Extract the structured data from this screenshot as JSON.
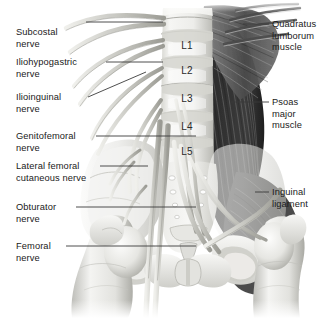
{
  "figure": {
    "palette": {
      "background": "#ffffff",
      "bone_light": "#f2f2f0",
      "bone_mid": "#d9d9d6",
      "bone_shadow": "#b3b3ae",
      "nerve_light": "#e4e4e0",
      "nerve_mid": "#bcbcb6",
      "nerve_dark": "#8d8d87",
      "muscle_dark": "#3a3a3a",
      "muscle_mid": "#6b6b6b",
      "muscle_light": "#9a9a9a",
      "leader_line": "#3b3b3b",
      "text": "#1a1a1a"
    }
  },
  "labels_left": [
    {
      "id": "subcostal-nerve",
      "lines": [
        "Subcostal",
        "nerve"
      ],
      "x": 16,
      "y": 27,
      "leader": {
        "x1": 86,
        "y1": 22,
        "x2": 163,
        "y2": 22
      }
    },
    {
      "id": "iliohypogastric-nerve",
      "lines": [
        "Iliohypogastric",
        "nerve"
      ],
      "x": 16,
      "y": 57,
      "leader": {
        "x1": 106,
        "y1": 62,
        "x2": 163,
        "y2": 62
      }
    },
    {
      "id": "ilioinguinal-nerve",
      "lines": [
        "Ilioinguinal",
        "nerve"
      ],
      "x": 16,
      "y": 92,
      "leader": {
        "x1": 88,
        "y1": 97,
        "x2": 146,
        "y2": 72
      }
    },
    {
      "id": "genitofemoral-nerve",
      "lines": [
        "Genitofemoral",
        "nerve"
      ],
      "x": 16,
      "y": 131,
      "leader": {
        "x1": 96,
        "y1": 136,
        "x2": 196,
        "y2": 136
      }
    },
    {
      "id": "lateral-femoral-cutaneous-nerve",
      "lines": [
        "Lateral femoral",
        "cutaneous nerve"
      ],
      "x": 16,
      "y": 161,
      "leader": {
        "x1": 100,
        "y1": 166,
        "x2": 148,
        "y2": 166
      }
    },
    {
      "id": "obturator-nerve",
      "lines": [
        "Obturator",
        "nerve"
      ],
      "x": 16,
      "y": 202,
      "leader": {
        "x1": 76,
        "y1": 207,
        "x2": 196,
        "y2": 207
      }
    },
    {
      "id": "femoral-nerve",
      "lines": [
        "Femoral",
        "nerve"
      ],
      "x": 16,
      "y": 241,
      "leader": {
        "x1": 66,
        "y1": 246,
        "x2": 196,
        "y2": 246
      }
    }
  ],
  "labels_right": [
    {
      "id": "quadratus-lumborum-muscle",
      "lines": [
        "Quadratus",
        "lumborum",
        "muscle"
      ],
      "x": 272,
      "y": 19,
      "leader": {
        "x1": 243,
        "y1": 24,
        "x2": 269,
        "y2": 24
      }
    },
    {
      "id": "psoas-major-muscle",
      "lines": [
        "Psoas",
        "major",
        "muscle"
      ],
      "x": 272,
      "y": 97,
      "leader": {
        "x1": 231,
        "y1": 102,
        "x2": 269,
        "y2": 102
      }
    },
    {
      "id": "inguinal-ligament",
      "lines": [
        "Inguinal",
        "ligament"
      ],
      "x": 272,
      "y": 187,
      "leader": {
        "x1": 255,
        "y1": 192,
        "x2": 269,
        "y2": 192
      }
    }
  ],
  "vertebrae": [
    {
      "id": "vertebra-l1",
      "label": "L1",
      "x": 187,
      "y": 46
    },
    {
      "id": "vertebra-l2",
      "label": "L2",
      "x": 187,
      "y": 71
    },
    {
      "id": "vertebra-l3",
      "label": "L3",
      "x": 187,
      "y": 99
    },
    {
      "id": "vertebra-l4",
      "label": "L4",
      "x": 187,
      "y": 127
    },
    {
      "id": "vertebra-l5",
      "label": "L5",
      "x": 187,
      "y": 152
    }
  ],
  "structures": [
    {
      "id": "lumbar-vertebral-column",
      "name": "Lumbar vertebral column"
    },
    {
      "id": "sacrum",
      "name": "Sacrum"
    },
    {
      "id": "coccyx",
      "name": "Coccyx"
    },
    {
      "id": "ilium-left",
      "name": "Left ilium"
    },
    {
      "id": "ilium-right",
      "name": "Right ilium"
    },
    {
      "id": "pubic-symphysis",
      "name": "Pubic symphysis"
    },
    {
      "id": "femur-left",
      "name": "Left femur"
    },
    {
      "id": "femur-right",
      "name": "Right femur"
    },
    {
      "id": "lumbar-plexus-nerves",
      "name": "Lumbar plexus nerve roots"
    }
  ]
}
